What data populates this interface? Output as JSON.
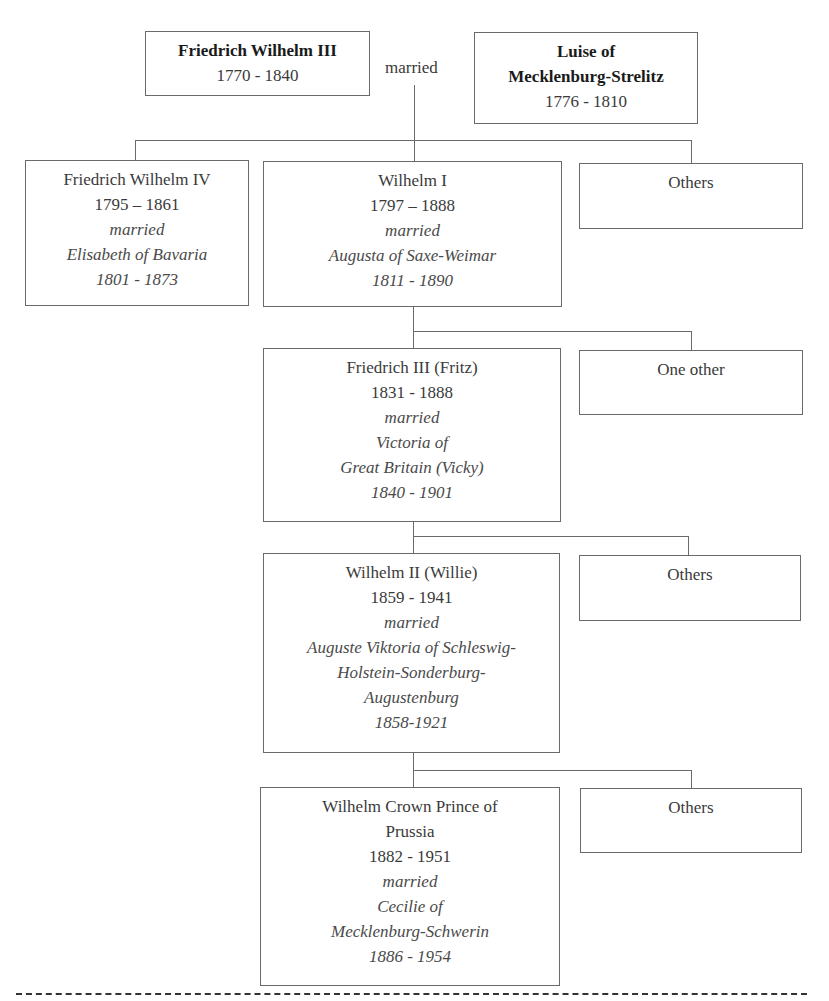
{
  "diagram": {
    "type": "family-tree",
    "parents": {
      "father": {
        "name": "Friedrich Wilhelm III",
        "dates": "1770 - 1840"
      },
      "connector_label": "married",
      "mother": {
        "name_line1": "Luise of",
        "name_line2": "Mecklenburg-Strelitz",
        "dates": "1776 - 1810"
      }
    },
    "generation1": {
      "fw4": {
        "name": "Friedrich Wilhelm IV",
        "dates": "1795 – 1861",
        "married": "married",
        "spouse": "Elisabeth of Bavaria",
        "spouse_dates": "1801 - 1873"
      },
      "wilhelm1": {
        "name": "Wilhelm I",
        "dates": "1797 – 1888",
        "married": "married",
        "spouse": "Augusta of Saxe-Weimar",
        "spouse_dates": "1811 - 1890"
      },
      "others": {
        "label": "Others"
      }
    },
    "generation2": {
      "fritz": {
        "name": "Friedrich III (Fritz)",
        "dates": "1831 - 1888",
        "married": "married",
        "spouse_line1": "Victoria of",
        "spouse_line2": "Great Britain (Vicky)",
        "spouse_dates": "1840 - 1901"
      },
      "others": {
        "label": "One other"
      }
    },
    "generation3": {
      "willie": {
        "name": "Wilhelm II (Willie)",
        "dates": "1859 - 1941",
        "married": "married",
        "spouse_line1": "Auguste Viktoria of Schleswig-",
        "spouse_line2": "Holstein-Sonderburg-",
        "spouse_line3": "Augustenburg",
        "spouse_dates": "1858-1921"
      },
      "others": {
        "label": "Others"
      }
    },
    "generation4": {
      "crown_prince": {
        "name_line1": "Wilhelm Crown Prince of",
        "name_line2": "Prussia",
        "dates": "1882 - 1951",
        "married": "married",
        "spouse_line1": "Cecilie of",
        "spouse_line2": "Mecklenburg-Schwerin",
        "spouse_dates": "1886 - 1954"
      },
      "others": {
        "label": "Others"
      }
    }
  }
}
